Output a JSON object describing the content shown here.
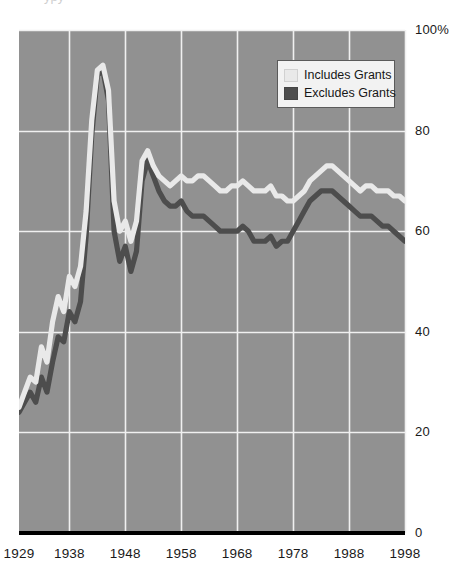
{
  "chart_data": {
    "type": "line",
    "title": "",
    "xlabel": "",
    "ylabel": "",
    "xlim": [
      1929,
      1998
    ],
    "ylim": [
      0,
      100
    ],
    "grid": true,
    "legend_position": "top-right",
    "x_tick_labels": [
      "1929",
      "1938",
      "1948",
      "1958",
      "1968",
      "1978",
      "1988",
      "1998"
    ],
    "x_tick_values": [
      1929,
      1938,
      1948,
      1958,
      1968,
      1978,
      1988,
      1998
    ],
    "y_tick_labels": [
      "100%",
      "80",
      "60",
      "40",
      "20",
      "0"
    ],
    "y_tick_values": [
      100,
      80,
      60,
      40,
      20,
      0
    ],
    "series": [
      {
        "name": "Includes Grants",
        "color": "#e9e9e9",
        "x": [
          1929,
          1930,
          1931,
          1932,
          1933,
          1934,
          1935,
          1936,
          1937,
          1938,
          1939,
          1940,
          1941,
          1942,
          1943,
          1944,
          1945,
          1946,
          1947,
          1948,
          1949,
          1950,
          1951,
          1952,
          1953,
          1954,
          1955,
          1956,
          1957,
          1958,
          1959,
          1960,
          1961,
          1962,
          1963,
          1964,
          1965,
          1966,
          1967,
          1968,
          1969,
          1970,
          1971,
          1972,
          1973,
          1974,
          1975,
          1976,
          1977,
          1978,
          1979,
          1980,
          1981,
          1982,
          1983,
          1984,
          1985,
          1986,
          1987,
          1988,
          1989,
          1990,
          1991,
          1992,
          1993,
          1994,
          1995,
          1996,
          1997,
          1998
        ],
        "values": [
          25,
          28,
          31,
          30,
          37,
          34,
          42,
          47,
          44,
          51,
          49,
          53,
          64,
          82,
          92,
          93,
          88,
          66,
          60,
          62,
          58,
          62,
          74,
          76,
          73,
          71,
          70,
          69,
          70,
          71,
          70,
          70,
          71,
          71,
          70,
          69,
          68,
          68,
          69,
          69,
          70,
          69,
          68,
          68,
          68,
          69,
          67,
          67,
          66,
          66,
          67,
          68,
          70,
          71,
          72,
          73,
          73,
          72,
          71,
          70,
          69,
          68,
          69,
          69,
          68,
          68,
          68,
          67,
          67,
          66
        ]
      },
      {
        "name": "Excludes Grants",
        "color": "#4d4d4d",
        "x": [
          1929,
          1930,
          1931,
          1932,
          1933,
          1934,
          1935,
          1936,
          1937,
          1938,
          1939,
          1940,
          1941,
          1942,
          1943,
          1944,
          1945,
          1946,
          1947,
          1948,
          1949,
          1950,
          1951,
          1952,
          1953,
          1954,
          1955,
          1956,
          1957,
          1958,
          1959,
          1960,
          1961,
          1962,
          1963,
          1964,
          1965,
          1966,
          1967,
          1968,
          1969,
          1970,
          1971,
          1972,
          1973,
          1974,
          1975,
          1976,
          1977,
          1978,
          1979,
          1980,
          1981,
          1982,
          1983,
          1984,
          1985,
          1986,
          1987,
          1988,
          1989,
          1990,
          1991,
          1992,
          1993,
          1994,
          1995,
          1996,
          1997,
          1998
        ],
        "values": [
          24,
          26,
          28,
          26,
          31,
          28,
          34,
          39,
          38,
          44,
          42,
          46,
          59,
          79,
          91,
          92,
          86,
          60,
          54,
          57,
          52,
          56,
          70,
          74,
          71,
          68,
          66,
          65,
          65,
          66,
          64,
          63,
          63,
          63,
          62,
          61,
          60,
          60,
          60,
          60,
          61,
          60,
          58,
          58,
          58,
          59,
          57,
          58,
          58,
          60,
          62,
          64,
          66,
          67,
          68,
          68,
          68,
          67,
          66,
          65,
          64,
          63,
          63,
          63,
          62,
          61,
          61,
          60,
          59,
          58
        ]
      }
    ]
  },
  "legend": {
    "items": [
      {
        "label": "Includes Grants",
        "color": "#e9e9e9"
      },
      {
        "label": "Excludes Grants",
        "color": "#4d4d4d"
      }
    ]
  },
  "style": {
    "plot_background": "#919191",
    "gridline_color": "#f0f0f0",
    "axis_color": "#000000",
    "tick_text_color": "#1a1a1a"
  }
}
